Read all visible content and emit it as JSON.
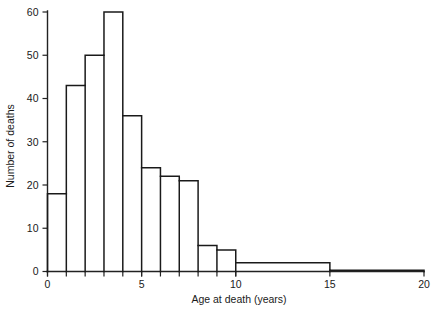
{
  "chart_data": {
    "type": "bar",
    "title": "",
    "xlabel": "Age at death (years)",
    "ylabel": "Number of deaths",
    "xlim": [
      0,
      20
    ],
    "ylim": [
      0,
      60
    ],
    "grid": false,
    "legend": "none",
    "xticks": [
      "0",
      "5",
      "10",
      "15",
      "20"
    ],
    "xtick_values": [
      0,
      5,
      10,
      15,
      20
    ],
    "yticks": [
      "0",
      "10",
      "20",
      "30",
      "40",
      "50",
      "60"
    ],
    "ytick_values": [
      0,
      10,
      20,
      30,
      40,
      50,
      60
    ],
    "bins": [
      {
        "start": 0,
        "end": 1,
        "value": 18
      },
      {
        "start": 1,
        "end": 2,
        "value": 43
      },
      {
        "start": 2,
        "end": 3,
        "value": 50
      },
      {
        "start": 3,
        "end": 4,
        "value": 60
      },
      {
        "start": 4,
        "end": 5,
        "value": 36
      },
      {
        "start": 5,
        "end": 6,
        "value": 24
      },
      {
        "start": 6,
        "end": 7,
        "value": 22
      },
      {
        "start": 7,
        "end": 8,
        "value": 21
      },
      {
        "start": 8,
        "end": 9,
        "value": 6
      },
      {
        "start": 9,
        "end": 10,
        "value": 5
      },
      {
        "start": 10,
        "end": 15,
        "value": 2
      },
      {
        "start": 15,
        "end": 20,
        "value": 0.3
      }
    ],
    "categories": [
      "0-1",
      "1-2",
      "2-3",
      "3-4",
      "4-5",
      "5-6",
      "6-7",
      "7-8",
      "8-9",
      "9-10",
      "10-15",
      "15-20"
    ],
    "values": [
      18,
      43,
      50,
      60,
      36,
      24,
      22,
      21,
      6,
      5,
      2,
      0.3
    ]
  },
  "colors": {
    "line": "#1a1a1a",
    "background": "#ffffff"
  }
}
